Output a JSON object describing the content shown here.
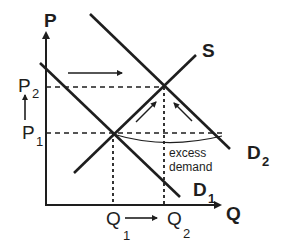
{
  "diagram": {
    "title": "",
    "axes": {
      "y_label": "P",
      "x_label": "Q"
    },
    "price_levels": {
      "p1": {
        "base": "P",
        "sub": "1"
      },
      "p2": {
        "base": "P",
        "sub": "2"
      }
    },
    "quantity_levels": {
      "q1": {
        "base": "Q",
        "sub": "1"
      },
      "q2": {
        "base": "Q",
        "sub": "2"
      }
    },
    "curves": {
      "supply": {
        "label": "S"
      },
      "demand1": {
        "base": "D",
        "sub": "1"
      },
      "demand2": {
        "base": "D",
        "sub": "2"
      }
    },
    "annotation": {
      "line1": "excess",
      "line2": "demand"
    },
    "colors": {
      "ink": "#1e1e1e",
      "background": "#ffffff"
    }
  }
}
